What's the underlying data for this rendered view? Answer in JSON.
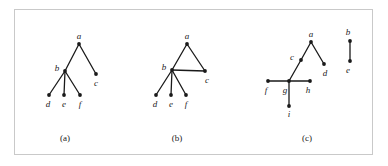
{
  "figure": {
    "frame": {
      "x": 14,
      "y": 9,
      "width": 359,
      "height": 146,
      "border_color": "#c9c9c9"
    },
    "background_color": "#ffffff",
    "ink_color": "#1a1a1a",
    "node_radius": 1.9,
    "edge_width": 1.3
  },
  "panels": [
    {
      "id": "panel-a",
      "caption": "(a)",
      "caption_pos": {
        "x": 65,
        "y": 138
      },
      "nodes": [
        {
          "id": "a",
          "label": "a",
          "x": 79,
          "y": 44,
          "label_x": 79,
          "label_y": 36
        },
        {
          "id": "b",
          "label": "b",
          "x": 65,
          "y": 71,
          "label_x": 57,
          "label_y": 68
        },
        {
          "id": "c",
          "label": "c",
          "x": 96,
          "y": 74,
          "label_x": 96,
          "label_y": 83
        },
        {
          "id": "d",
          "label": "d",
          "x": 49,
          "y": 95,
          "label_x": 48,
          "label_y": 104
        },
        {
          "id": "e",
          "label": "e",
          "x": 64,
          "y": 95,
          "label_x": 64,
          "label_y": 104
        },
        {
          "id": "f",
          "label": "f",
          "x": 80,
          "y": 95,
          "label_x": 80,
          "label_y": 104
        }
      ],
      "edges": [
        {
          "from": "a",
          "to": "b"
        },
        {
          "from": "a",
          "to": "c"
        },
        {
          "from": "b",
          "to": "d"
        },
        {
          "from": "b",
          "to": "e"
        },
        {
          "from": "b",
          "to": "f"
        }
      ]
    },
    {
      "id": "panel-b",
      "caption": "(b)",
      "caption_pos": {
        "x": 177,
        "y": 138
      },
      "nodes": [
        {
          "id": "a",
          "label": "a",
          "x": 187,
          "y": 44,
          "label_x": 187,
          "label_y": 36
        },
        {
          "id": "b",
          "label": "b",
          "x": 172,
          "y": 70,
          "label_x": 164,
          "label_y": 67
        },
        {
          "id": "c",
          "label": "c",
          "x": 205,
          "y": 71,
          "label_x": 207,
          "label_y": 80
        },
        {
          "id": "d",
          "label": "d",
          "x": 156,
          "y": 95,
          "label_x": 155,
          "label_y": 104
        },
        {
          "id": "e",
          "label": "e",
          "x": 171,
          "y": 95,
          "label_x": 171,
          "label_y": 104
        },
        {
          "id": "f",
          "label": "f",
          "x": 186,
          "y": 95,
          "label_x": 186,
          "label_y": 104
        }
      ],
      "edges": [
        {
          "from": "a",
          "to": "b"
        },
        {
          "from": "a",
          "to": "c"
        },
        {
          "from": "b",
          "to": "c"
        },
        {
          "from": "b",
          "to": "d"
        },
        {
          "from": "b",
          "to": "e"
        },
        {
          "from": "b",
          "to": "f"
        }
      ]
    },
    {
      "id": "panel-c",
      "caption": "(c)",
      "caption_pos": {
        "x": 307,
        "y": 138
      },
      "nodes": [
        {
          "id": "a",
          "label": "a",
          "x": 311,
          "y": 42,
          "label_x": 311,
          "label_y": 34
        },
        {
          "id": "c",
          "label": "c",
          "x": 301,
          "y": 60,
          "label_x": 292,
          "label_y": 57
        },
        {
          "id": "d",
          "label": "d",
          "x": 324,
          "y": 64,
          "label_x": 325,
          "label_y": 73
        },
        {
          "id": "f",
          "label": "f",
          "x": 268,
          "y": 81,
          "label_x": 266,
          "label_y": 90
        },
        {
          "id": "g",
          "label": "g",
          "x": 289,
          "y": 81,
          "label_x": 285,
          "label_y": 90
        },
        {
          "id": "h",
          "label": "h",
          "x": 310,
          "y": 81,
          "label_x": 308,
          "label_y": 90
        },
        {
          "id": "i",
          "label": "i",
          "x": 289,
          "y": 106,
          "label_x": 289,
          "label_y": 114
        },
        {
          "id": "b",
          "label": "b",
          "x": 350,
          "y": 41,
          "label_x": 348,
          "label_y": 32
        },
        {
          "id": "e",
          "label": "e",
          "x": 350,
          "y": 61,
          "label_x": 348,
          "label_y": 70
        }
      ],
      "edges": [
        {
          "from": "a",
          "to": "c"
        },
        {
          "from": "a",
          "to": "d"
        },
        {
          "from": "c",
          "to": "g"
        },
        {
          "from": "f",
          "to": "g"
        },
        {
          "from": "g",
          "to": "h"
        },
        {
          "from": "g",
          "to": "i"
        },
        {
          "from": "b",
          "to": "e"
        }
      ]
    }
  ]
}
